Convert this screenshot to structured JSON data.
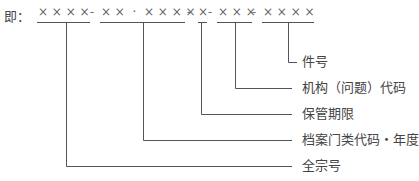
{
  "prefix": "即：",
  "code_string": "××××-××・××××-×-×××-××××",
  "segments": [
    {
      "chars": "× × × ×",
      "x1": 37,
      "x2": 90,
      "stem": 66
    },
    {
      "chars": "× ×  ·  × × × ×",
      "x1": 100,
      "x2": 185,
      "stem": 143
    },
    {
      "chars": "×",
      "x1": 198,
      "x2": 207,
      "stem": 201
    },
    {
      "chars": "× × ×",
      "x1": 217,
      "x2": 252,
      "stem": 235
    },
    {
      "chars": "× × × ×",
      "x1": 262,
      "x2": 314,
      "stem": 288
    }
  ],
  "separators": [
    {
      "text": "-",
      "x": 91
    },
    {
      "text": "-",
      "x": 189
    },
    {
      "text": "-",
      "x": 208
    }
  ],
  "labels": [
    {
      "text": "件号",
      "y": 62
    },
    {
      "text": "机构（问题）代码",
      "y": 88
    },
    {
      "text": "保管期限",
      "y": 114
    },
    {
      "text": "档案门类代码・年度",
      "y": 140
    },
    {
      "text": "全宗号",
      "y": 166
    }
  ],
  "colors": {
    "line": "#555555",
    "text": "#444444",
    "code": "#777777"
  }
}
